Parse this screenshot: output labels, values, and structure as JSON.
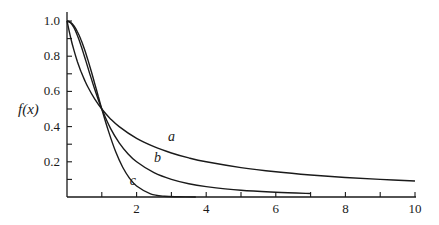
{
  "chart_data": {
    "type": "line",
    "title": "",
    "xlabel": "",
    "ylabel": "f(x)",
    "xlim": [
      0,
      10
    ],
    "ylim": [
      0,
      1.0
    ],
    "grid": false,
    "legend": "none (curves labeled inline a, b, c)",
    "x_ticks": [
      1,
      2,
      3,
      4,
      5,
      6,
      7,
      8,
      9,
      10
    ],
    "x_tick_labels": [
      {
        "value": 2,
        "label": "2"
      },
      {
        "value": 4,
        "label": "4"
      },
      {
        "value": 6,
        "label": "6"
      },
      {
        "value": 8,
        "label": "8"
      },
      {
        "value": 10,
        "label": "10"
      }
    ],
    "y_ticks": [
      0.1,
      0.2,
      0.3,
      0.4,
      0.5,
      0.6,
      0.7,
      0.8,
      0.9,
      1.0
    ],
    "y_tick_labels": [
      {
        "value": 0.2,
        "label": "0.2"
      },
      {
        "value": 0.4,
        "label": "0.4"
      },
      {
        "value": 0.6,
        "label": "0.6"
      },
      {
        "value": 0.8,
        "label": "0.8"
      },
      {
        "value": 1.0,
        "label": "1.0"
      }
    ],
    "series": [
      {
        "name": "a",
        "label_pos": [
          2.9,
          0.32
        ],
        "x": [
          0,
          0.1,
          0.2,
          0.3,
          0.4,
          0.5,
          0.6,
          0.8,
          1.0,
          1.25,
          1.5,
          2,
          2.5,
          3,
          3.5,
          4,
          5,
          6,
          7,
          8,
          9,
          10
        ],
        "values": [
          1.0,
          0.909,
          0.833,
          0.769,
          0.714,
          0.667,
          0.625,
          0.556,
          0.5,
          0.444,
          0.4,
          0.333,
          0.286,
          0.25,
          0.222,
          0.2,
          0.167,
          0.143,
          0.125,
          0.111,
          0.1,
          0.091
        ]
      },
      {
        "name": "b",
        "label_pos": [
          2.5,
          0.2
        ],
        "x": [
          0,
          0.1,
          0.2,
          0.3,
          0.4,
          0.5,
          0.6,
          0.7,
          0.8,
          0.9,
          1.0,
          1.25,
          1.5,
          1.75,
          2,
          2.5,
          3,
          3.5,
          4,
          5,
          6,
          7
        ],
        "values": [
          1.0,
          0.99,
          0.962,
          0.917,
          0.862,
          0.8,
          0.735,
          0.671,
          0.61,
          0.552,
          0.5,
          0.39,
          0.308,
          0.246,
          0.2,
          0.138,
          0.1,
          0.075,
          0.059,
          0.038,
          0.027,
          0.02
        ]
      },
      {
        "name": "c",
        "label_pos": [
          1.8,
          0.07
        ],
        "x": [
          0,
          0.1,
          0.2,
          0.3,
          0.4,
          0.5,
          0.6,
          0.7,
          0.8,
          0.9,
          1.0,
          1.2,
          1.4,
          1.6,
          1.8,
          2.0,
          2.4,
          2.8,
          3.2,
          3.7
        ],
        "values": [
          1.0,
          0.993,
          0.973,
          0.939,
          0.895,
          0.841,
          0.779,
          0.712,
          0.642,
          0.571,
          0.5,
          0.369,
          0.257,
          0.169,
          0.106,
          0.0625,
          0.018,
          0.004,
          0.001,
          0.0
        ]
      }
    ]
  }
}
